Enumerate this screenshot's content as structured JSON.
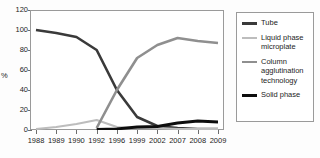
{
  "chart_data": {
    "type": "line",
    "title": "",
    "xlabel": "",
    "ylabel": "%",
    "categories": [
      "1988",
      "1989",
      "1990",
      "1992",
      "1996",
      "1999",
      "2002",
      "2007",
      "2008",
      "2009"
    ],
    "ylim": [
      0,
      120
    ],
    "yticks": [
      0,
      20,
      40,
      60,
      80,
      100,
      120
    ],
    "grid": false,
    "legend_position": "right",
    "series": [
      {
        "name": "Tube",
        "color": "#3a3a3a",
        "width": 2.6,
        "values": [
          100,
          97,
          93,
          80,
          40,
          13,
          4,
          2,
          1,
          1
        ]
      },
      {
        "name": "Liquid phase microplate",
        "color": "#bdbdbd",
        "width": 2.2,
        "values": [
          1,
          3,
          6,
          10,
          3,
          2,
          2,
          1,
          1,
          1
        ]
      },
      {
        "name": "Column agglutination technology",
        "color": "#8f8f8f",
        "width": 2.6,
        "values": [
          null,
          null,
          null,
          2,
          40,
          72,
          85,
          92,
          89,
          87
        ]
      },
      {
        "name": "Solid phase",
        "color": "#0d0d0d",
        "width": 2.8,
        "values": [
          null,
          null,
          null,
          0.5,
          1,
          3,
          3.5,
          7,
          9,
          8
        ]
      }
    ]
  },
  "axis": {
    "y_title": "%",
    "y_labels": [
      "120",
      "100",
      "80",
      "60",
      "40",
      "20",
      "0"
    ],
    "x_labels": [
      "1988",
      "1989",
      "1990",
      "1992",
      "1996",
      "1999",
      "2002",
      "2007",
      "2008",
      "2009"
    ]
  },
  "legend": {
    "items": [
      {
        "label": "Tube",
        "color": "#3a3a3a",
        "thickness": "2.6px"
      },
      {
        "label": "Liquid phase\nmicroplate",
        "color": "#bdbdbd",
        "thickness": "2.4px"
      },
      {
        "label": "Column\nagglutination\ntechnology",
        "color": "#8f8f8f",
        "thickness": "2.4px"
      },
      {
        "label": "Solid phase",
        "color": "#0d0d0d",
        "thickness": "3px"
      }
    ]
  },
  "colors": {
    "frame": "#9a9a9a",
    "text": "#1c1c1c",
    "plot_background": "#ffffff",
    "page_background": "#fdfdfd"
  }
}
